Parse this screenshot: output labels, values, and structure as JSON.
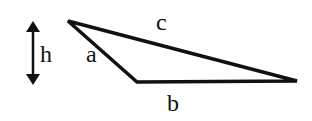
{
  "diagram": {
    "type": "triangle",
    "labels": {
      "height": "h",
      "side_a": "a",
      "side_b": "b",
      "side_c": "c"
    },
    "vertices": {
      "top": [
        68,
        21
      ],
      "bottom_left": [
        137,
        82
      ],
      "right": [
        297,
        81
      ]
    },
    "height_arrow": {
      "x": 33,
      "y1": 22,
      "y2": 84
    },
    "colors": {
      "stroke": "#111111",
      "background": "#ffffff"
    }
  }
}
